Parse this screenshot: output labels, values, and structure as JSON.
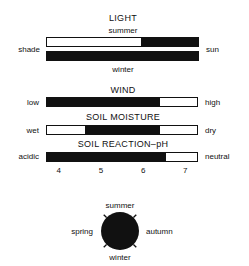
{
  "light": {
    "title": "LIGHT",
    "left_label": "shade",
    "right_label": "sun",
    "summer_label": "summer",
    "winter_label": "winter",
    "summer_range": [
      0.62,
      1.0
    ],
    "winter_range": [
      0.0,
      1.0
    ]
  },
  "wind": {
    "title": "WIND",
    "left_label": "low",
    "right_label": "high",
    "range": [
      0.0,
      0.75
    ]
  },
  "soil_moisture": {
    "title": "SOIL MOISTURE",
    "left_label": "wet",
    "right_label": "dry",
    "range": [
      0.25,
      0.75
    ]
  },
  "soil_reaction": {
    "title": "SOIL REACTION–pH",
    "left_label": "acidic",
    "right_label": "neutral",
    "ph_range": [
      3.7,
      6.55
    ],
    "ph_axis": [
      3.7,
      7.3
    ],
    "ticks": [
      "4",
      "5",
      "6",
      "7"
    ]
  },
  "season": {
    "top": "summer",
    "bottom": "winter",
    "left": "spring",
    "right": "autumn",
    "color": "#111111"
  }
}
